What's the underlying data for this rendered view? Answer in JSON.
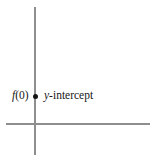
{
  "figure": {
    "type": "coordinate-axes-diagram",
    "background_color": "#ffffff",
    "width": 157,
    "height": 162,
    "axis_color": "#8e8e8e",
    "point_color": "#151515",
    "text_color": "#171717"
  },
  "axes": {
    "vertical": {
      "name": "y-axis",
      "x": 35,
      "top": 7,
      "bottom": 155
    },
    "horizontal": {
      "name": "x-axis",
      "y": 124,
      "left": 6,
      "right": 150
    }
  },
  "point": {
    "name": "y-intercept-point",
    "x": 35,
    "y": 96,
    "radius": 2.5
  },
  "labels": {
    "function_value": {
      "full": "f(0)",
      "function_name": "f",
      "arguments": "(0)"
    },
    "intercept": {
      "full": "y-intercept",
      "variable": "y",
      "suffix": "-intercept"
    }
  },
  "chart_data": {
    "type": "scatter",
    "title": "",
    "subtitle": "",
    "xlabel": "",
    "ylabel": "",
    "grid": false,
    "legend": false,
    "axis_lines": {
      "x_axis_at_y": 0,
      "y_axis_at_x": 0
    },
    "points": [
      {
        "label": "y-intercept",
        "annotation": "f(0)",
        "x": 0,
        "y": 1,
        "marker": "filled-circle"
      }
    ]
  }
}
